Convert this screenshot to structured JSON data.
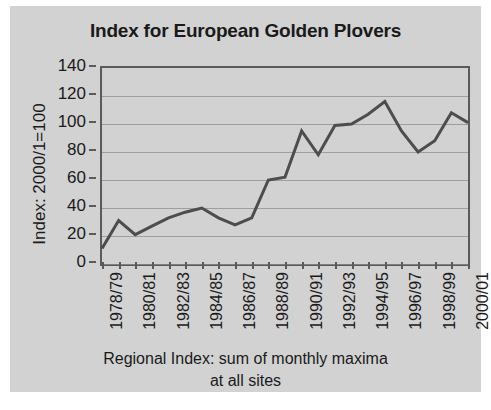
{
  "figure": {
    "background_color": "#d2d2d2",
    "page_background_color": "#ffffff",
    "line_color": "#4d4d4d",
    "axis_color": "#5a5a5a",
    "grid_color": "#8c8c8c"
  },
  "chart_data": {
    "type": "line",
    "title": "Index for European Golden Plovers",
    "xlabel_line1": "Regional Index: sum of monthly maxima",
    "xlabel_line2": "at all sites",
    "ylabel": "Index: 2000/1=100",
    "ylim": [
      0,
      140
    ],
    "yticks": [
      0,
      20,
      40,
      60,
      80,
      100,
      120,
      140
    ],
    "ytick_labels": [
      "0",
      "20",
      "40",
      "60",
      "80",
      "100",
      "120",
      "140"
    ],
    "grid": true,
    "legend": "none",
    "categories": [
      "1978/79",
      "1979/80",
      "1980/81",
      "1981/82",
      "1982/83",
      "1983/84",
      "1984/85",
      "1985/86",
      "1986/87",
      "1987/88",
      "1988/89",
      "1989/90",
      "1990/91",
      "1991/92",
      "1992/93",
      "1993/94",
      "1994/95",
      "1995/96",
      "1996/97",
      "1997/98",
      "1998/99",
      "1999/00",
      "2000/01"
    ],
    "xtick_labels": [
      "1978/79",
      "1980/81",
      "1982/83",
      "1984/85",
      "1986/87",
      "1988/89",
      "1990/91",
      "1992/93",
      "1994/95",
      "1996/97",
      "1998/99",
      "2000/01"
    ],
    "xtick_label_indices": [
      0,
      2,
      4,
      6,
      8,
      10,
      12,
      14,
      16,
      18,
      20,
      22
    ],
    "values": [
      11,
      31,
      21,
      27,
      33,
      37,
      40,
      33,
      28,
      33,
      60,
      62,
      95,
      78,
      99,
      100,
      107,
      116,
      95,
      80,
      88,
      108,
      101
    ],
    "series_name": "Index"
  }
}
